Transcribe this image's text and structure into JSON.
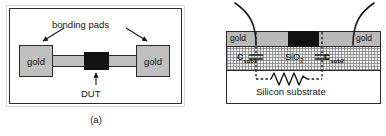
{
  "figure": {
    "panel_a": {
      "caption": "(a)",
      "annotation_bonding_pads": "bonding pads",
      "annotation_dut": "DUT",
      "pad_left_label": "gold",
      "pad_right_label": "gold",
      "elements": {
        "dut_block": "black-rectangle",
        "trace": "gray-interconnect",
        "arrow_left": "arrow-to-left-pad",
        "arrow_right": "arrow-to-right-pad",
        "arrow_dut": "arrow-to-dut"
      }
    },
    "panel_b": {
      "caption": "(b)",
      "gold_left_label": "gold",
      "gold_right_label": "gold",
      "oxide_label": "SiO",
      "oxide_label_sub": "2",
      "substrate_label": "Silicon substrate",
      "cap_left_label": "C",
      "cap_left_sub": "sub1",
      "cap_right_label": "C",
      "cap_right_sub": "sub2",
      "elements": {
        "bond_wire_left": "curved-bond-wire",
        "bond_wire_right": "curved-bond-wire",
        "dut_block": "black-rectangle",
        "resistor": "zigzag-resistor",
        "dashed_network": "dashed-equivalent-circuit"
      }
    },
    "colors": {
      "gold_fill": "#bfbfbf",
      "gold_fill_b": "#b9b9b9",
      "dut_black": "#121212",
      "outline": "#2b2b2b",
      "oxide_fill": "#f0f0f0",
      "background": "#ffffff"
    }
  }
}
